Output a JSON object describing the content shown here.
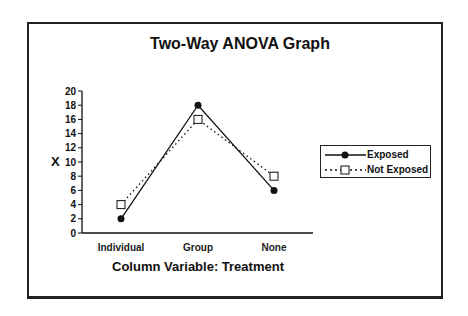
{
  "chart_data": {
    "type": "line",
    "title": "Two-Way ANOVA Graph",
    "xlabel": "Column Variable: Treatment",
    "ylabel": "X",
    "categories": [
      "Individual",
      "Group",
      "None"
    ],
    "series": [
      {
        "name": "Exposed",
        "values": [
          2,
          18,
          6
        ],
        "style": "solid",
        "marker": "filled-circle"
      },
      {
        "name": "Not Exposed",
        "values": [
          4,
          16,
          8
        ],
        "style": "dotted",
        "marker": "open-square"
      }
    ],
    "ylim": [
      0,
      20
    ],
    "yticks": [
      0,
      2,
      4,
      6,
      8,
      10,
      12,
      14,
      16,
      18,
      20
    ],
    "grid": false,
    "legend_position": "right"
  },
  "legend": {
    "items": [
      "Exposed",
      "Not Exposed"
    ]
  },
  "colors": {
    "line": "#111111",
    "frame": "#222222",
    "background": "#ffffff"
  }
}
